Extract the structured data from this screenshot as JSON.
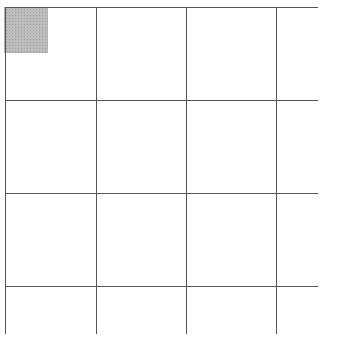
{
  "board": {
    "rows": 4,
    "cols": 4,
    "line_color": "#555555",
    "background": "#ffffff",
    "vertical_lines_x": [
      5,
      96,
      186,
      276
    ],
    "horizontal_lines_y": [
      7,
      100,
      193,
      286
    ],
    "lines_extent": {
      "x_end": 318,
      "y_end": 334
    },
    "selected_cell": {
      "row": 0,
      "col": 0
    },
    "marker": {
      "x": 4,
      "y": 7,
      "width": 44,
      "height": 46,
      "color": "#bdbdbd"
    }
  }
}
